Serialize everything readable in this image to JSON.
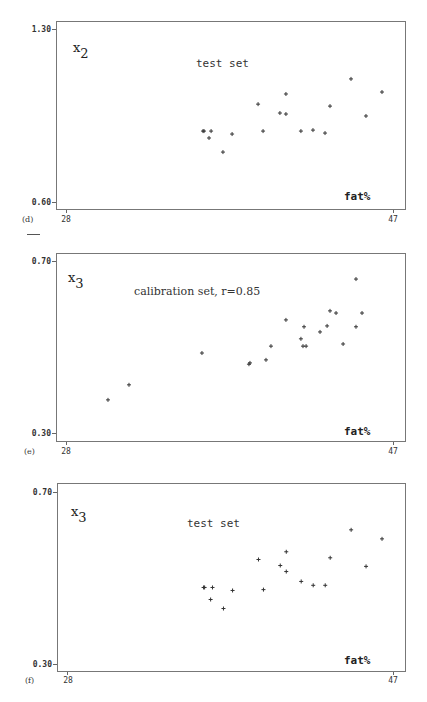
{
  "chart_data": [
    {
      "panel_label": "(d)",
      "type": "scatter",
      "title": "test set",
      "ylabel": "x",
      "ylabel_subscript": "2",
      "xlabel": "fat%",
      "xlim": [
        28,
        47
      ],
      "ylim": [
        0.6,
        1.3
      ],
      "x_ticks": [
        "28",
        "47"
      ],
      "y_ticks": [
        "1.30",
        "0.60"
      ],
      "grid": false,
      "points": [
        [
          35.96,
          0.887
        ],
        [
          36.02,
          0.887
        ],
        [
          36.43,
          0.887
        ],
        [
          36.31,
          0.859
        ],
        [
          37.12,
          0.802
        ],
        [
          37.65,
          0.875
        ],
        [
          39.16,
          0.996
        ],
        [
          39.45,
          0.887
        ],
        [
          40.43,
          0.96
        ],
        [
          40.78,
          1.037
        ],
        [
          40.78,
          0.956
        ],
        [
          41.65,
          0.887
        ],
        [
          42.35,
          0.891
        ],
        [
          43.05,
          0.879
        ],
        [
          43.34,
          0.988
        ],
        [
          44.56,
          1.098
        ],
        [
          45.43,
          0.948
        ],
        [
          46.36,
          1.045
        ]
      ]
    },
    {
      "panel_label": "(e)",
      "type": "scatter",
      "title": "calibration set, r=0.85",
      "ylabel": "x",
      "ylabel_subscript": "3",
      "xlabel": "fat%",
      "xlim": [
        28,
        47
      ],
      "ylim": [
        0.3,
        0.7
      ],
      "x_ticks": [
        "28",
        "47"
      ],
      "y_ticks": [
        "0.70",
        "0.30"
      ],
      "grid": false,
      "points": [
        [
          30.44,
          0.377
        ],
        [
          31.66,
          0.412
        ],
        [
          35.9,
          0.486
        ],
        [
          38.63,
          0.46
        ],
        [
          38.69,
          0.463
        ],
        [
          39.62,
          0.47
        ],
        [
          39.91,
          0.502
        ],
        [
          40.78,
          0.563
        ],
        [
          41.65,
          0.519
        ],
        [
          41.77,
          0.502
        ],
        [
          41.95,
          0.502
        ],
        [
          41.83,
          0.547
        ],
        [
          42.76,
          0.535
        ],
        [
          43.17,
          0.549
        ],
        [
          43.34,
          0.584
        ],
        [
          43.69,
          0.579
        ],
        [
          44.1,
          0.507
        ],
        [
          44.85,
          0.547
        ],
        [
          44.85,
          0.658
        ],
        [
          45.2,
          0.579
        ]
      ]
    },
    {
      "panel_label": "(f)",
      "type": "scatter",
      "title": "test set",
      "ylabel": "x",
      "ylabel_subscript": "3",
      "xlabel": "fat%",
      "xlim": [
        28,
        47
      ],
      "ylim": [
        0.3,
        0.7
      ],
      "x_ticks": [
        "28",
        "47"
      ],
      "y_ticks": [
        "0.70",
        "0.30"
      ],
      "grid": false,
      "points": [
        [
          35.96,
          0.478
        ],
        [
          36.02,
          0.478
        ],
        [
          36.48,
          0.478
        ],
        [
          36.37,
          0.45
        ],
        [
          37.12,
          0.429
        ],
        [
          37.65,
          0.471
        ],
        [
          39.16,
          0.543
        ],
        [
          39.45,
          0.473
        ],
        [
          40.43,
          0.529
        ],
        [
          40.78,
          0.561
        ],
        [
          40.78,
          0.515
        ],
        [
          41.65,
          0.492
        ],
        [
          42.35,
          0.483
        ],
        [
          43.05,
          0.483
        ],
        [
          43.34,
          0.547
        ],
        [
          44.56,
          0.612
        ],
        [
          45.43,
          0.527
        ],
        [
          46.36,
          0.591
        ]
      ]
    }
  ]
}
